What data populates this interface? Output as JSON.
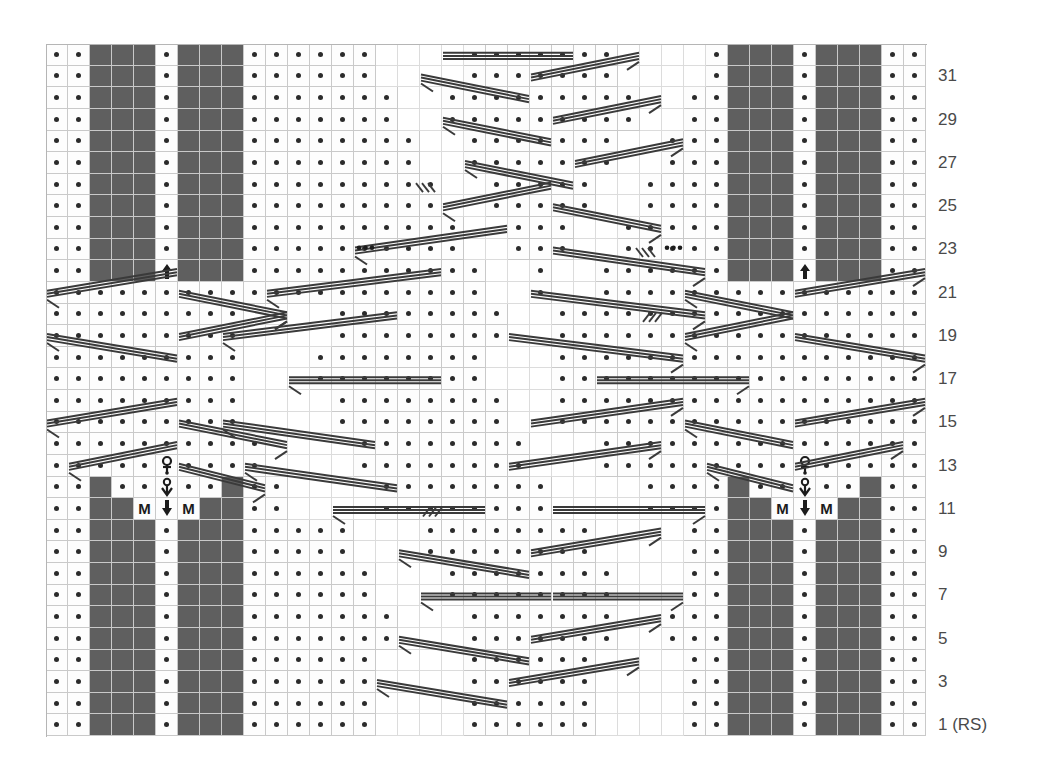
{
  "chart": {
    "columns": 40,
    "rows": 32,
    "cell_px": 22,
    "colors": {
      "knit_fill": "#5f5f5f",
      "background": "#fdfdfd",
      "grid_line": "#c9c9c9",
      "symbol": "#1c1c1c",
      "label_text": "#4a4a4a"
    },
    "row_labels": [
      {
        "row": 31,
        "text": "31"
      },
      {
        "row": 29,
        "text": "29"
      },
      {
        "row": 27,
        "text": "27"
      },
      {
        "row": 25,
        "text": "25"
      },
      {
        "row": 23,
        "text": "23"
      },
      {
        "row": 21,
        "text": "21"
      },
      {
        "row": 19,
        "text": "19"
      },
      {
        "row": 17,
        "text": "17"
      },
      {
        "row": 15,
        "text": "15"
      },
      {
        "row": 13,
        "text": "13"
      },
      {
        "row": 11,
        "text": "11"
      },
      {
        "row": 9,
        "text": "9"
      },
      {
        "row": 7,
        "text": "7"
      },
      {
        "row": 5,
        "text": "5"
      },
      {
        "row": 3,
        "text": "3"
      },
      {
        "row": 1,
        "text": "1 (RS)"
      }
    ],
    "legend_symbols": {
      "purl": "dot",
      "knit": "dark-filled-cell",
      "make_one": "M",
      "centered_double_decrease": "up-arrow",
      "yarn_over_loop": "loop-over-dot",
      "slip_marker": "down-arrow",
      "blank": "no-stitch"
    },
    "cells": [
      "..KKK.KKK......___......______KKK.KKK..",
      "..KKK.KKK......___......______KKK.KKK..",
      "..KKK.KKK.......__......_____.KKK.KKK..",
      "..KKK.KKK.......__......_____.KKK.KKK..",
      "..KKK.KKK.......__......_____.KKK.KKK..",
      "..KKK.KKK.......__......_____.KKK.KKK..",
      "..KKK.KKK.......__......_____.KKK.KKK..",
      "..KKK.KKK.......__......_____.KKK.KKK..",
      "..KKK.KKK.......__......_____.KKK.KKK..",
      "..KKK.KKK.......__......_____.KKK.KKK..",
      "..KKKAKKK.......__......_____KKKAKKK..",
      "...................................... ",
      "...................................... ",
      "...................................... ",
      "...................................... ",
      "...................................... ",
      "...................................... ",
      "...................................... ",
      "...................................... ",
      "..QQ............................QQ....",
      "..KK.K..........................KK.K..",
      "..K.MvM.K.......................K.MvM.",
      "..KKK.KKK.......................KKK.KKK",
      "..KKK.KKK.......................KKK.KKK",
      "..KKK.KKK.......................KKK.KKK",
      "..KKK.KKK.......................KKK.KKK",
      "..KKK.KKK.......................KKK.KKK",
      "..KKK.KKK.......................KKK.KKK",
      "..KKK.KKK.......................KKK.KKK",
      "..KKK.KKK.......................KKK.KKK",
      "..KKK.KKK.......................KKK.KKK",
      "..KKK.KKK.......................KKK.KKK"
    ],
    "grid_spec": {
      "knit_block_columns_left": [
        2,
        3,
        4,
        6,
        7,
        8
      ],
      "knit_block_columns_right": [
        31,
        32,
        33,
        35,
        36,
        37
      ],
      "purl_rail_columns": [
        0,
        1,
        38,
        39
      ],
      "center_spine_column_left": 5,
      "center_spine_column_right": 34
    }
  }
}
